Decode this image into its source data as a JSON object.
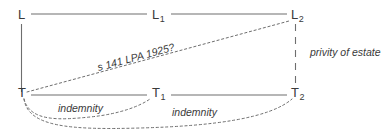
{
  "diagram": {
    "type": "legal-relationship-diagram",
    "colors": {
      "line": "#6e6e6e",
      "text": "#3a3a3a",
      "background": "#ffffff"
    },
    "nodes": [
      {
        "id": "L",
        "base": "L",
        "sub": "",
        "x": 18,
        "y": 8,
        "role": "original-landlord"
      },
      {
        "id": "L1",
        "base": "L",
        "sub": "1",
        "x": 152,
        "y": 8,
        "role": "landlord-assignee-1"
      },
      {
        "id": "L2",
        "base": "L",
        "sub": "2",
        "x": 291,
        "y": 8,
        "role": "landlord-assignee-2"
      },
      {
        "id": "T",
        "base": "T",
        "sub": "",
        "x": 18,
        "y": 86,
        "role": "original-tenant"
      },
      {
        "id": "T1",
        "base": "T",
        "sub": "1",
        "x": 152,
        "y": 86,
        "role": "tenant-assignee-1"
      },
      {
        "id": "T2",
        "base": "T",
        "sub": "2",
        "x": 291,
        "y": 86,
        "role": "tenant-assignee-2"
      }
    ],
    "edges": [
      {
        "id": "L-L1",
        "from": "L",
        "to": "L1",
        "style": "solid",
        "label": ""
      },
      {
        "id": "L1-L2",
        "from": "L1",
        "to": "L2",
        "style": "solid",
        "label": ""
      },
      {
        "id": "L-T",
        "from": "L",
        "to": "T",
        "style": "solid",
        "label": ""
      },
      {
        "id": "T-T1",
        "from": "T",
        "to": "T1",
        "style": "solid",
        "label": ""
      },
      {
        "id": "T1-T2",
        "from": "T1",
        "to": "T2",
        "style": "solid",
        "label": ""
      },
      {
        "id": "L2-T2",
        "from": "L2",
        "to": "T2",
        "style": "dashed",
        "label": "privity of estate"
      },
      {
        "id": "T-L2",
        "from": "T",
        "to": "L2",
        "style": "dotted",
        "label": "s 141 LPA 1925?"
      },
      {
        "id": "T-T1-curve",
        "from": "T",
        "to": "T1",
        "style": "dotted-curve",
        "label": "indemnity"
      },
      {
        "id": "T-T2-curve",
        "from": "T",
        "to": "T2",
        "style": "dotted-curve",
        "label": "indemnity"
      }
    ],
    "labels": {
      "privity": "privity of estate",
      "statute": "s 141 LPA 1925?",
      "indemnity_1": "indemnity",
      "indemnity_2": "indemnity"
    }
  }
}
